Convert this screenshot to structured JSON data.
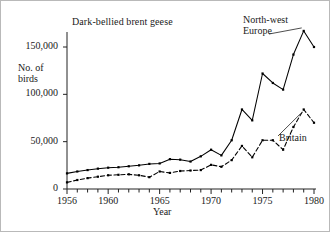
{
  "chart_data": {
    "type": "line",
    "title": "Dark-bellied brent geese",
    "xlabel": "Year",
    "ylabel": "No. of\nbirds",
    "xlim": [
      1956,
      1980
    ],
    "ylim": [
      0,
      175000
    ],
    "grid": false,
    "legend_position": "inline-annotation",
    "x_tick_labels": [
      "1956",
      "1960",
      "1965",
      "1970",
      "1975",
      "1980"
    ],
    "x_tick_values": [
      1956,
      1960,
      1965,
      1970,
      1975,
      1980
    ],
    "x_minor_ticks_every": 1,
    "y_tick_labels": [
      "0",
      "50,000",
      "100,000",
      "150,000"
    ],
    "y_tick_values": [
      0,
      50000,
      100000,
      150000
    ],
    "x": [
      1956,
      1957,
      1958,
      1959,
      1960,
      1961,
      1962,
      1963,
      1964,
      1965,
      1966,
      1967,
      1968,
      1969,
      1970,
      1971,
      1972,
      1973,
      1974,
      1975,
      1976,
      1977,
      1978,
      1979,
      1980
    ],
    "series": [
      {
        "name": "North-west Europe",
        "style": "solid",
        "marker": "square",
        "color": "#000000",
        "values": [
          16500,
          18500,
          20000,
          21500,
          22500,
          23000,
          24000,
          25000,
          26500,
          27000,
          31500,
          31000,
          29000,
          34500,
          41500,
          35500,
          51500,
          84000,
          72500,
          122000,
          112000,
          105000,
          142000,
          167000,
          150000
        ]
      },
      {
        "name": "Britain",
        "style": "dashed",
        "marker": "square",
        "color": "#000000",
        "values": [
          7000,
          9500,
          11500,
          13000,
          14500,
          15000,
          15500,
          14500,
          12500,
          18500,
          17000,
          19000,
          19500,
          20000,
          25500,
          23500,
          30500,
          45500,
          33500,
          51500,
          51500,
          41500,
          65500,
          84000,
          70000
        ]
      }
    ],
    "annotations": [
      {
        "name": "north-west-europe-label",
        "text": "North-west\nEurope",
        "target_year": 1979
      },
      {
        "name": "britain-label",
        "text": "Britain",
        "target_year": 1979
      }
    ]
  }
}
